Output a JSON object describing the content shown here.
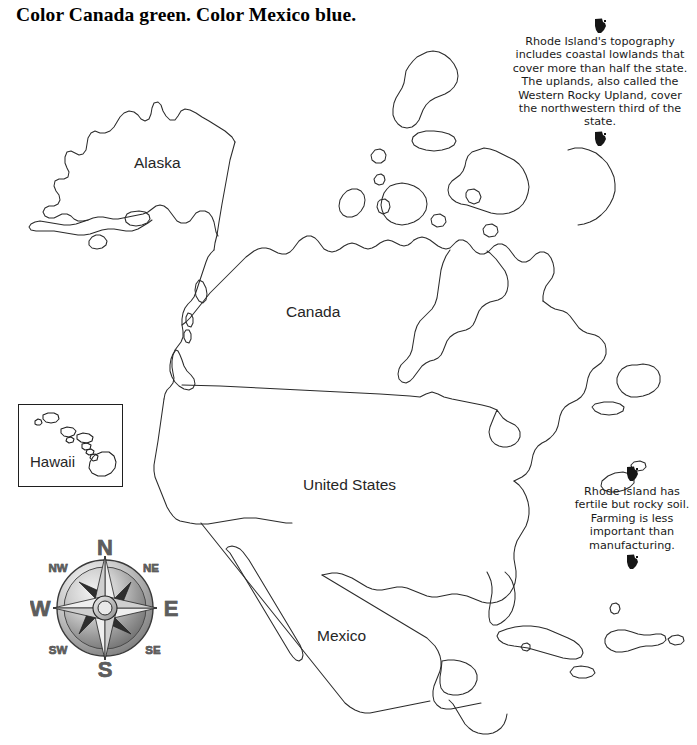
{
  "title": "Color Canada green. Color Mexico blue.",
  "map": {
    "labels": {
      "alaska": "Alaska",
      "canada": "Canada",
      "united_states": "United States",
      "mexico": "Mexico"
    },
    "inset": {
      "name": "Hawaii"
    }
  },
  "compass": {
    "north": "N",
    "south": "S",
    "east": "E",
    "west": "W",
    "northeast": "NE",
    "northwest": "NW",
    "southeast": "SE",
    "southwest": "SW"
  },
  "annotations": {
    "top": {
      "text": "Rhode Island's topography includes coastal lowlands that cover more than half the state.  The uplands, also called the Western Rocky Upland, cover the northwestern third of the state."
    },
    "bottom": {
      "text": "Rhode Island has fertile but rocky soil.  Farming is less important than manufacturing."
    }
  },
  "colors": {
    "background": "#ffffff",
    "outline": "#2b2b2b",
    "text": "#1a1a1a",
    "label": "#262626",
    "compass_letter": "#5d5d5d"
  }
}
